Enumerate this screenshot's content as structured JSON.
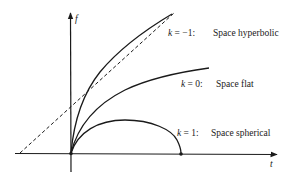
{
  "diagram": {
    "axes": {
      "x_label": "t",
      "y_label": "f"
    },
    "curves": [
      {
        "id": "hyperbolic",
        "k_var": "k",
        "k_eq": " = −1:",
        "description": "Space hyperbolic"
      },
      {
        "id": "flat",
        "k_var": "k",
        "k_eq": " = 0:",
        "description": "Space flat"
      },
      {
        "id": "spherical",
        "k_var": "k",
        "k_eq": " = 1:",
        "description": "Space spherical"
      }
    ],
    "asymptote": {
      "style": "dashed"
    },
    "colors": {
      "stroke": "#1a1a1a",
      "background": "#ffffff"
    }
  }
}
